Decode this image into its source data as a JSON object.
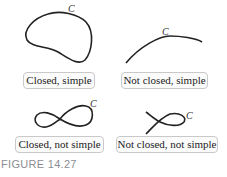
{
  "figure": {
    "caption": "FIGURE 14.27",
    "curve_color": "#222222",
    "panels": [
      {
        "id": "closed-simple",
        "label": "Closed, simple",
        "curve_name": "C",
        "closed": true,
        "simple": true
      },
      {
        "id": "not-closed-simple",
        "label": "Not closed, simple",
        "curve_name": "C",
        "closed": false,
        "simple": true
      },
      {
        "id": "closed-not-simple",
        "label": "Closed, not simple",
        "curve_name": "C",
        "closed": true,
        "simple": false
      },
      {
        "id": "not-closed-not-simple",
        "label": "Not closed, not simple",
        "curve_name": "C",
        "closed": false,
        "simple": false
      }
    ]
  }
}
